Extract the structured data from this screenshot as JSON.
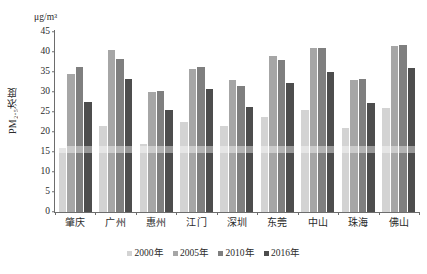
{
  "chart_data": {
    "type": "bar",
    "title": "",
    "subtitle": "",
    "unit_label": "μg/m³",
    "ylabel": "PM₂.₅浓度",
    "xlabel": "",
    "ylim": [
      0,
      45
    ],
    "ytick_step": 5,
    "yticks": [
      45,
      40,
      35,
      30,
      25,
      20,
      15,
      10,
      5,
      0
    ],
    "grid": false,
    "legend_position": "bottom",
    "categories": [
      "肇庆",
      "广州",
      "惠州",
      "江门",
      "深圳",
      "东莞",
      "中山",
      "珠海",
      "佛山"
    ],
    "series": [
      {
        "name": "2000年",
        "color": "#d3d3d3",
        "values": [
          15.9,
          21.4,
          17.0,
          22.5,
          21.4,
          23.7,
          25.5,
          21.0,
          26.0
        ]
      },
      {
        "name": "2005年",
        "color": "#a6a6a6",
        "values": [
          34.4,
          40.5,
          29.9,
          35.8,
          33.0,
          39.0,
          41.0,
          33.0,
          41.5
        ]
      },
      {
        "name": "2010年",
        "color": "#7f7f7f",
        "values": [
          36.3,
          38.2,
          30.3,
          36.3,
          31.5,
          38.0,
          41.0,
          33.3,
          41.8
        ]
      },
      {
        "name": "2016年",
        "color": "#4d4d4d",
        "values": [
          27.4,
          33.2,
          25.4,
          30.8,
          26.3,
          32.3,
          35.0,
          27.2,
          36.0
        ]
      }
    ]
  }
}
